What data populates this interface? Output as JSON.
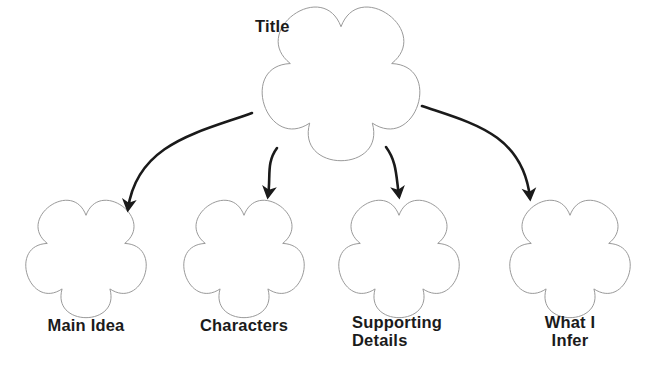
{
  "page": {
    "type": "graphic-organizer",
    "background_color": "#ffffff",
    "shape_outline_color": "#9a9a9a",
    "arrow_color": "#1a1a1a",
    "text_color": "#1b1b1b"
  },
  "title_node": {
    "label": "Title",
    "shape": "five-lobe-flower",
    "center_x": 341,
    "center_y": 80,
    "radius": 72,
    "label_x": 255,
    "label_y": 17
  },
  "child_nodes": [
    {
      "label": "Main Idea",
      "label_lines": [
        "Main Idea"
      ],
      "align": "center",
      "shape": "five-lobe-flower",
      "center_x": 86,
      "center_y": 256,
      "radius": 55,
      "label_x": 86,
      "label_y": 316
    },
    {
      "label": "Characters",
      "label_lines": [
        "Characters"
      ],
      "align": "center",
      "shape": "five-lobe-flower",
      "center_x": 244,
      "center_y": 256,
      "radius": 55,
      "label_x": 244,
      "label_y": 316
    },
    {
      "label": "Supporting Details",
      "label_lines": [
        "Supporting",
        "Details"
      ],
      "align": "left",
      "shape": "five-lobe-flower",
      "center_x": 399,
      "center_y": 256,
      "radius": 55,
      "label_x": 352,
      "label_y": 313
    },
    {
      "label": "What I Infer",
      "label_lines": [
        "What I",
        "Infer"
      ],
      "align": "center",
      "shape": "five-lobe-flower",
      "center_x": 570,
      "center_y": 256,
      "radius": 55,
      "label_x": 570,
      "label_y": 313
    }
  ],
  "arrows": [
    {
      "name": "arrow-to-main-idea",
      "from": [
        252,
        113
      ],
      "to": [
        128,
        209
      ],
      "curve": "convex-left-long"
    },
    {
      "name": "arrow-to-characters",
      "from": [
        277,
        148
      ],
      "to": [
        268,
        196
      ],
      "curve": "short-steep-left"
    },
    {
      "name": "arrow-to-supporting-details",
      "from": [
        386,
        147
      ],
      "to": [
        399,
        196
      ],
      "curve": "short-steep-right"
    },
    {
      "name": "arrow-to-what-i-infer",
      "from": [
        422,
        106
      ],
      "to": [
        530,
        198
      ],
      "curve": "convex-right-long"
    }
  ]
}
